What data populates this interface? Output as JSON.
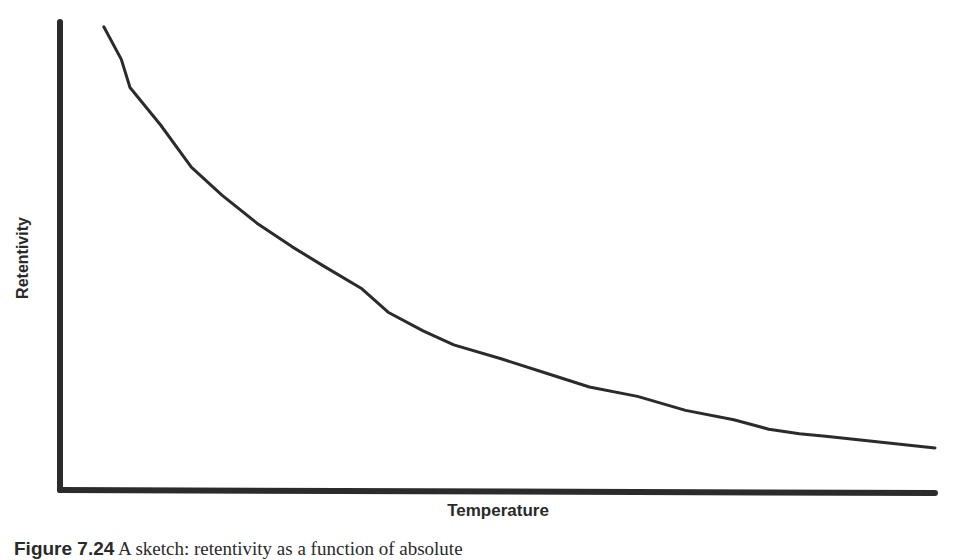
{
  "chart_data": {
    "type": "line",
    "title": "",
    "xlabel": "Temperature",
    "ylabel": "Retentivity",
    "grid": false,
    "legend": null,
    "x_ticks": [],
    "y_ticks": [],
    "x": [
      0.05,
      0.07,
      0.08,
      0.115,
      0.15,
      0.185,
      0.225,
      0.265,
      0.3,
      0.345,
      0.375,
      0.415,
      0.45,
      0.505,
      0.555,
      0.605,
      0.66,
      0.715,
      0.77,
      0.81,
      0.845,
      0.875,
      1.0
    ],
    "series": [
      {
        "name": "Retentivity",
        "values": [
          0.99,
          0.92,
          0.86,
          0.78,
          0.69,
          0.63,
          0.57,
          0.52,
          0.48,
          0.43,
          0.38,
          0.34,
          0.31,
          0.28,
          0.25,
          0.22,
          0.2,
          0.17,
          0.15,
          0.13,
          0.12,
          0.115,
          0.09
        ]
      }
    ],
    "xlim": [
      0,
      1
    ],
    "ylim": [
      0,
      1
    ]
  },
  "labels": {
    "ylabel": "Retentivity",
    "xlabel": "Temperature",
    "caption_prefix": "Figure 7.24",
    "caption_text": "  A sketch: retentivity as a function of absolute"
  },
  "plot": {
    "left": 60,
    "top": 22,
    "right": 935,
    "bottom": 490,
    "axis_color": "#2b2b2b",
    "line_color": "#2b2b2b"
  }
}
